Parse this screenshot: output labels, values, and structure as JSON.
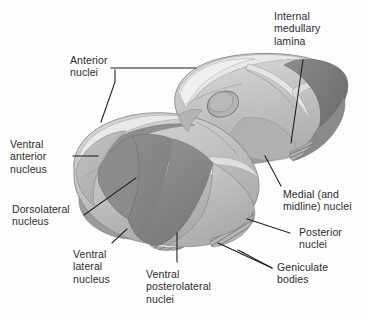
{
  "figure": {
    "background_color": "#fdfdfd",
    "line_color": "#1a1a1a",
    "text_color": "#2b2b2b"
  },
  "labels": {
    "anterior_nuclei": "Anterior\nnuclei",
    "internal_medullary_lamina": "Internal\nmedullary\nlamina",
    "ventral_anterior_nucleus": "Ventral\nanterior\nnucleus",
    "dorsolateral_nucleus": "Dorsolateral\nnucleus",
    "ventral_lateral_nucleus": "Ventral\nlateral\nnucleus",
    "ventral_posterolateral_nuclei": "Ventral\nposterolateral\nnuclei",
    "medial_midline_nuclei": "Medial (and\nmidline) nuclei",
    "posterior_nuclei": "Posterior\nnuclei",
    "geniculate_bodies": "Geniculate\nbodies"
  },
  "palette": {
    "white": "#fdfdfd",
    "lightest": "#e6e6e6",
    "light": "#d2d2d2",
    "light_mid": "#c2c2c2",
    "mid": "#b2b2b2",
    "mid_dark": "#9c9c9c",
    "dark": "#878787",
    "darker": "#767676",
    "darkest": "#5f5f5f",
    "outline": "#6a6a6a"
  },
  "structures": [
    {
      "name": "right-thalamic-body",
      "description": "Upper right thalamus with interthalamic adhesion oval"
    },
    {
      "name": "left-thalamic-body",
      "description": "Lower left thalamus with ventral nuclear groups"
    },
    {
      "name": "interthalamic-adhesion",
      "description": "Oval depression on upper body"
    },
    {
      "name": "geniculate-bodies-hatching",
      "description": "Hatched posterior inferior margin"
    }
  ]
}
